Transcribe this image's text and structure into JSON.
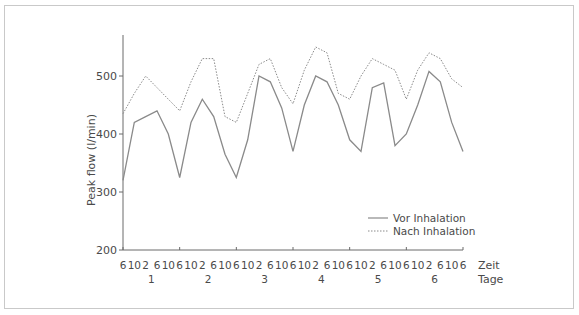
{
  "chart_data": {
    "type": "line",
    "title": "",
    "xlabel": "Zeit",
    "xlabel2": "Tage",
    "ylabel": "Peak flow (l/min)",
    "ylim": [
      200,
      570
    ],
    "yticks": [
      200,
      300,
      400,
      500
    ],
    "x_tick_labels": [
      "6",
      "10",
      "2",
      "6",
      "10",
      "6",
      "10",
      "2",
      "6",
      "10",
      "6",
      "10",
      "2",
      "6",
      "10",
      "6",
      "10",
      "2",
      "6",
      "10",
      "6",
      "10",
      "2",
      "6",
      "10",
      "6",
      "10",
      "2",
      "6",
      "10",
      "6"
    ],
    "day_labels": [
      "1",
      "2",
      "3",
      "4",
      "5",
      "6"
    ],
    "legend_position": "lower right",
    "grid": false,
    "series": [
      {
        "name": "Vor Inhalation",
        "style": "solid",
        "values": [
          320,
          420,
          430,
          440,
          400,
          325,
          420,
          460,
          430,
          365,
          325,
          390,
          500,
          490,
          445,
          370,
          450,
          500,
          490,
          450,
          390,
          370,
          480,
          488,
          380,
          400,
          450,
          508,
          490,
          420,
          370
        ]
      },
      {
        "name": "Nach Inhalation",
        "style": "dotted",
        "values": [
          435,
          470,
          500,
          480,
          460,
          440,
          490,
          530,
          530,
          430,
          420,
          470,
          520,
          530,
          480,
          452,
          510,
          550,
          540,
          470,
          460,
          500,
          530,
          520,
          510,
          460,
          510,
          540,
          530,
          495,
          480
        ]
      }
    ]
  },
  "colors": {
    "line": "#8a8a8a",
    "axis": "#6a6a6a",
    "frame": "#c9c9c9"
  }
}
